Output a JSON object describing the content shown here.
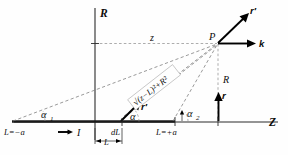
{
  "figure": {
    "kind": "physics-vector-diagram",
    "background_color": "#fefefe",
    "ink_color": "#0d0d0d",
    "dash_color": "#787878"
  },
  "axes": {
    "vertical_label": "R",
    "horizontal_label": "Z"
  },
  "labels": {
    "point_p": "P",
    "distance_z": "z",
    "perp_distance_R": "R",
    "left_end": "L=−a",
    "right_end": "L=+a",
    "current": "I",
    "element": "dL",
    "dimension_L": "L",
    "hypotenuse": "√(z−L)²+R²",
    "angle_alpha": "α",
    "angle_alpha1": "α",
    "angle_alpha1_sub": "1",
    "angle_alpha2": "α",
    "angle_alpha2_sub": "2",
    "vector_r_prime_at_p": "r′",
    "vector_k": "k",
    "vector_r": "r",
    "vector_r_prime_at_dl": "r′"
  },
  "geometry": {
    "z_axis_y": 122,
    "r_axis_x": 95,
    "point_p": {
      "x": 218,
      "y": 43
    },
    "wire_start_x": 12,
    "wire_end_x": 175,
    "dl_x": 122
  }
}
